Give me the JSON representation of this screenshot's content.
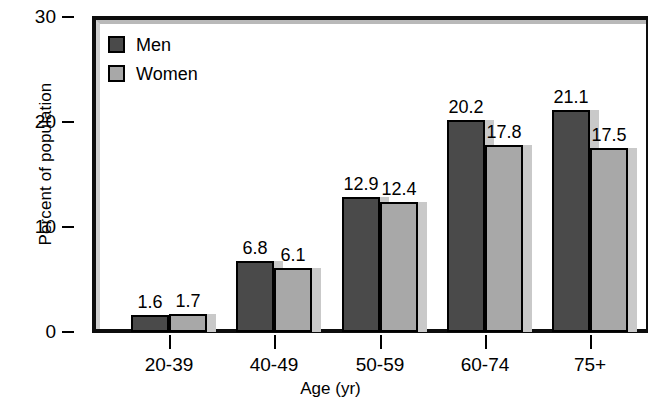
{
  "chart_data": {
    "type": "bar",
    "title": "",
    "xlabel": "Age (yr)",
    "ylabel": "Percent of population",
    "categories": [
      "20-39",
      "40-49",
      "50-59",
      "60-74",
      "75+"
    ],
    "series": [
      {
        "name": "Men",
        "color": "#4a4a4a",
        "values": [
          1.6,
          6.8,
          12.9,
          20.2,
          21.1
        ]
      },
      {
        "name": "Women",
        "color": "#a8a8a8",
        "values": [
          1.7,
          6.1,
          12.4,
          17.8,
          17.5
        ]
      }
    ],
    "value_labels": [
      [
        "1.6",
        "1.7"
      ],
      [
        "6.8",
        "6.1"
      ],
      [
        "12.9",
        "12.4"
      ],
      [
        "20.2",
        "17.8"
      ],
      [
        "21.1",
        "17.5"
      ]
    ],
    "ylim": [
      0,
      30
    ],
    "yticks": [
      0,
      10,
      20,
      30
    ],
    "ytick_labels": [
      "0",
      "10",
      "20",
      "30"
    ],
    "grid": false,
    "legend_position": "top-left",
    "legend_entries": [
      "Men",
      "Women"
    ]
  }
}
